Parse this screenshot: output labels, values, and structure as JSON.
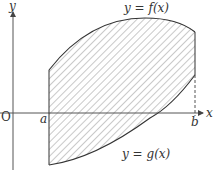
{
  "diagram": {
    "type": "area-between-curves",
    "labels": {
      "y_axis": "y",
      "x_axis": "x",
      "origin": "O",
      "a": "a",
      "b": "b",
      "f_curve": "y = f(x)",
      "g_curve": "y = g(x)"
    },
    "colors": {
      "axes": "#555555",
      "curves": "#333333",
      "hatch": "#777777",
      "background": "#ffffff"
    }
  }
}
